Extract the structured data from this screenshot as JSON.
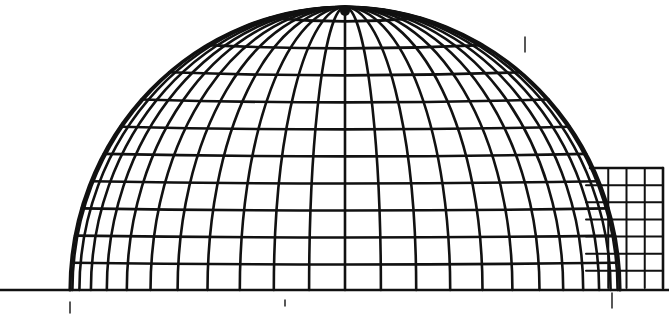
{
  "drawing": {
    "subject": "hand-drawn geodesic-style dome sketch",
    "ink_color": "#111111",
    "paper_color": "#ffffff",
    "dome": {
      "center_x": 345,
      "base_y": 290,
      "radius_x": 275,
      "radius_y": 283,
      "meridians": 24,
      "parallels": 10
    },
    "annex": {
      "x": 590,
      "y": 168,
      "width": 73,
      "height": 120,
      "columns": 4,
      "rows": 7
    },
    "ground_line": {
      "x1": 0,
      "x2": 669,
      "y": 290
    },
    "tick_marks": [
      {
        "x": 70,
        "y1": 302,
        "y2": 313
      },
      {
        "x": 525,
        "y1": 37,
        "y2": 52
      },
      {
        "x": 612,
        "y1": 293,
        "y2": 308
      },
      {
        "x": 285,
        "y1": 300,
        "y2": 306
      }
    ]
  }
}
